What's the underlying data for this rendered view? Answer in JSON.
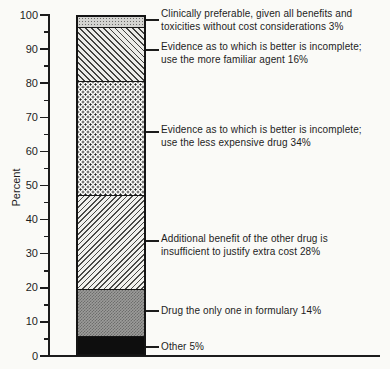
{
  "chart_data": {
    "type": "bar",
    "title": "",
    "xlabel": "",
    "ylabel": "Percent",
    "ylim": [
      0,
      100
    ],
    "y_major_ticks": [
      0,
      10,
      20,
      30,
      40,
      50,
      60,
      70,
      80,
      90,
      100
    ],
    "y_minor_tick_step": 5,
    "grid": false,
    "legend_position": "right-annotations",
    "stack_order_top_to_bottom": true,
    "segments": [
      {
        "label": "Clinically preferable, given all benefits and toxicities without cost considerations",
        "value": 3,
        "value_label": "3%",
        "pattern": "light-stipple",
        "label_lines": [
          "Clinically preferable, given all benefits and",
          "toxicities without cost considerations 3%"
        ]
      },
      {
        "label": "Evidence as to which is better is incomplete; use the more familiar agent",
        "value": 16,
        "value_label": "16%",
        "pattern": "diagonal-down-hatch",
        "label_lines": [
          "Evidence as to which is better is incomplete;",
          "use the more familiar agent 16%"
        ]
      },
      {
        "label": "Evidence as to which is better is incomplete; use the less expensive drug",
        "value": 34,
        "value_label": "34%",
        "pattern": "dots",
        "label_lines": [
          "Evidence as to which is better is incomplete;",
          "use the less expensive drug 34%"
        ]
      },
      {
        "label": "Additional benefit of the other drug is insufficient to justify extra cost",
        "value": 28,
        "value_label": "28%",
        "pattern": "diagonal-up-hatch",
        "label_lines": [
          "Additional benefit of the other drug is",
          "insufficient to justify extra cost 28%"
        ]
      },
      {
        "label": "Drug the only one in formulary",
        "value": 14,
        "value_label": "14%",
        "pattern": "gray-checker",
        "label_lines": [
          "Drug the only one in formulary 14%"
        ]
      },
      {
        "label": "Other",
        "value": 5,
        "value_label": "5%",
        "pattern": "solid-black",
        "label_lines": [
          "Other 5%"
        ]
      }
    ],
    "colors": {
      "ink": "#1c1c1c",
      "background": "#fafaf7"
    }
  }
}
